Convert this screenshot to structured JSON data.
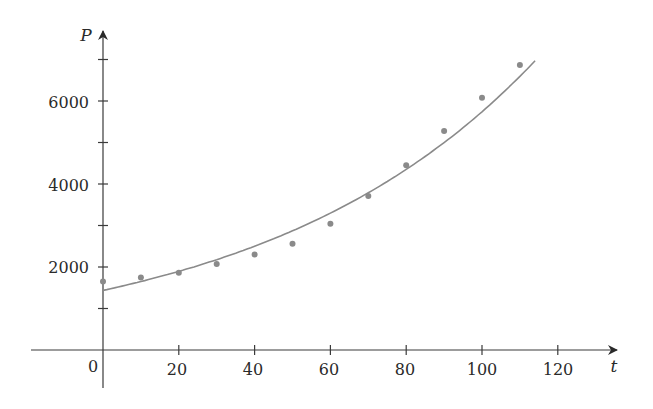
{
  "chart_data": {
    "type": "scatter",
    "title": "",
    "xlabel": "t",
    "ylabel": "P",
    "xlim": [
      -19,
      135
    ],
    "ylim": [
      -500,
      7800
    ],
    "x_ticks": [
      20,
      40,
      60,
      80,
      100,
      120
    ],
    "x_tick_labels": [
      "0",
      "20",
      "40",
      "60",
      "80",
      "100",
      "120"
    ],
    "y_ticks": [
      1000,
      2000,
      3000,
      4000,
      5000,
      6000,
      7000
    ],
    "y_tick_labels": [
      "2000",
      "4000",
      "6000"
    ],
    "grid": false,
    "legend": null,
    "series": [
      {
        "name": "data",
        "kind": "scatter",
        "x": [
          0,
          10,
          20,
          30,
          40,
          50,
          60,
          70,
          80,
          90,
          100,
          110
        ],
        "y": [
          1650,
          1750,
          1860,
          2070,
          2300,
          2560,
          3040,
          3710,
          4450,
          5280,
          6080,
          6870
        ],
        "color": "#8a8a8a"
      },
      {
        "name": "exponential model",
        "kind": "line",
        "model": "P = 1436.53 * 1.01395^t",
        "t_range": [
          0,
          114
        ],
        "color": "#8a8a8a"
      }
    ]
  },
  "labels": {
    "x_axis": "t",
    "y_axis": "P",
    "origin": "0",
    "x20": "20",
    "x40": "40",
    "x60": "60",
    "x80": "80",
    "x100": "100",
    "x120": "120",
    "y2000": "2000",
    "y4000": "4000",
    "y6000": "6000"
  }
}
